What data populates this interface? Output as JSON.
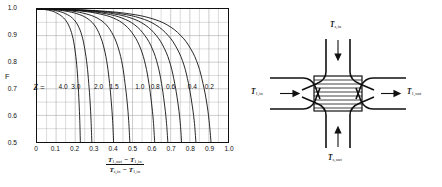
{
  "chart_data": {
    "type": "line",
    "title": "",
    "xlabel_numerator": "T1,out - T1,in",
    "xlabel_denominator": "Ts,in - T1,in",
    "ylabel": "F",
    "xlim": [
      0.0,
      1.0
    ],
    "ylim": [
      0.5,
      1.0
    ],
    "grid": true,
    "legend_position": "inline",
    "xticks": [
      "0",
      "0.1",
      "0.2",
      "0.3",
      "0.4",
      "0.5",
      "0.6",
      "0.7",
      "0.8",
      "0.9",
      "1.0"
    ],
    "xtick_values": [
      0,
      0.1,
      0.2,
      0.3,
      0.4,
      0.5,
      0.6,
      0.7,
      0.8,
      0.9,
      1.0
    ],
    "yticks": [
      "0.5",
      "0.6",
      "0.7",
      "0.8",
      "0.9",
      "1.0"
    ],
    "ytick_values": [
      0.5,
      0.6,
      0.7,
      0.8,
      0.9,
      1.0
    ],
    "series_parameter": "Z",
    "series": [
      {
        "name": "4.0",
        "label": "Z = 4.0",
        "x": [
          0.0,
          0.04,
          0.08,
          0.11,
          0.14,
          0.165,
          0.185,
          0.198,
          0.208,
          0.215,
          0.22,
          0.224,
          0.227
        ],
        "y": [
          1.0,
          0.998,
          0.992,
          0.982,
          0.966,
          0.94,
          0.9,
          0.85,
          0.79,
          0.72,
          0.65,
          0.58,
          0.5
        ]
      },
      {
        "name": "3.0",
        "label": "3.0",
        "x": [
          0.0,
          0.06,
          0.11,
          0.15,
          0.185,
          0.213,
          0.235,
          0.25,
          0.262,
          0.271,
          0.278,
          0.283,
          0.287
        ],
        "y": [
          1.0,
          0.998,
          0.992,
          0.982,
          0.966,
          0.94,
          0.9,
          0.85,
          0.79,
          0.72,
          0.65,
          0.58,
          0.5
        ]
      },
      {
        "name": "2.0",
        "label": "2.0",
        "x": [
          0.0,
          0.08,
          0.15,
          0.21,
          0.26,
          0.3,
          0.33,
          0.352,
          0.368,
          0.38,
          0.389,
          0.396,
          0.401
        ],
        "y": [
          1.0,
          0.998,
          0.992,
          0.982,
          0.966,
          0.94,
          0.9,
          0.85,
          0.79,
          0.72,
          0.65,
          0.58,
          0.5
        ]
      },
      {
        "name": "1.5",
        "label": "1.5",
        "x": [
          0.0,
          0.1,
          0.185,
          0.255,
          0.315,
          0.363,
          0.4,
          0.427,
          0.447,
          0.461,
          0.472,
          0.48,
          0.486
        ],
        "y": [
          1.0,
          0.998,
          0.992,
          0.982,
          0.966,
          0.94,
          0.9,
          0.85,
          0.79,
          0.72,
          0.65,
          0.58,
          0.5
        ]
      },
      {
        "name": "1.0",
        "label": "1.0",
        "x": [
          0.0,
          0.125,
          0.235,
          0.325,
          0.4,
          0.46,
          0.508,
          0.543,
          0.568,
          0.586,
          0.599,
          0.609,
          0.616
        ],
        "y": [
          1.0,
          0.998,
          0.992,
          0.982,
          0.966,
          0.94,
          0.9,
          0.85,
          0.79,
          0.72,
          0.65,
          0.58,
          0.5
        ]
      },
      {
        "name": "0.8",
        "label": "0.8",
        "x": [
          0.0,
          0.138,
          0.262,
          0.362,
          0.445,
          0.512,
          0.565,
          0.604,
          0.632,
          0.652,
          0.666,
          0.677,
          0.685
        ],
        "y": [
          1.0,
          0.998,
          0.992,
          0.982,
          0.966,
          0.94,
          0.9,
          0.85,
          0.79,
          0.72,
          0.65,
          0.58,
          0.5
        ]
      },
      {
        "name": "0.6",
        "label": "0.6",
        "x": [
          0.0,
          0.152,
          0.29,
          0.4,
          0.492,
          0.566,
          0.625,
          0.668,
          0.699,
          0.721,
          0.737,
          0.749,
          0.757
        ],
        "y": [
          1.0,
          0.998,
          0.992,
          0.982,
          0.966,
          0.94,
          0.9,
          0.85,
          0.79,
          0.72,
          0.65,
          0.58,
          0.5
        ]
      },
      {
        "name": "0.4",
        "label": "0.4",
        "x": [
          0.0,
          0.166,
          0.318,
          0.44,
          0.54,
          0.622,
          0.687,
          0.734,
          0.769,
          0.793,
          0.81,
          0.823,
          0.832
        ],
        "y": [
          1.0,
          0.998,
          0.992,
          0.982,
          0.966,
          0.94,
          0.9,
          0.85,
          0.79,
          0.72,
          0.65,
          0.58,
          0.5
        ]
      },
      {
        "name": "0.2",
        "label": "0.2",
        "x": [
          0.0,
          0.182,
          0.348,
          0.482,
          0.592,
          0.682,
          0.753,
          0.805,
          0.843,
          0.869,
          0.888,
          0.901,
          0.911
        ],
        "y": [
          1.0,
          0.998,
          0.992,
          0.982,
          0.966,
          0.94,
          0.9,
          0.85,
          0.79,
          0.72,
          0.65,
          0.58,
          0.5
        ]
      }
    ],
    "series_label_positions": [
      {
        "label": "4.0",
        "x": 0.148,
        "y": 0.704
      },
      {
        "label": "3.0",
        "x": 0.214,
        "y": 0.704
      },
      {
        "label": "2.0",
        "x": 0.332,
        "y": 0.704
      },
      {
        "label": "1.5",
        "x": 0.412,
        "y": 0.704
      },
      {
        "label": "1.0",
        "x": 0.545,
        "y": 0.704
      },
      {
        "label": "0.8",
        "x": 0.625,
        "y": 0.704
      },
      {
        "label": "0.6",
        "x": 0.705,
        "y": 0.704
      },
      {
        "label": "0.4",
        "x": 0.818,
        "y": 0.704
      },
      {
        "label": "0.2",
        "x": 0.905,
        "y": 0.704
      }
    ],
    "series_label_prefix": "Z",
    "series_label_equals": "= ",
    "colors": {
      "curve": "#111111",
      "grid": "#9a9a9a",
      "axis": "#111111"
    }
  },
  "schematic": {
    "name": "cross-flow-heat-exchanger",
    "labels": {
      "top": {
        "sym": "T",
        "sub": "s,in"
      },
      "bottom": {
        "sym": "T",
        "sub": "s,out"
      },
      "left": {
        "sym": "T",
        "sub": "1,in"
      },
      "right": {
        "sym": "T",
        "sub": "1,out"
      }
    }
  }
}
